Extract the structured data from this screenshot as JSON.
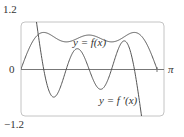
{
  "chart_data": {
    "type": "line",
    "title": "",
    "xlabel": "",
    "ylabel": "",
    "xlim": [
      0,
      3.14159
    ],
    "ylim": [
      -1.2,
      1.2
    ],
    "x_tick_labels": [
      "0",
      "π"
    ],
    "y_tick_labels": [
      "1.2",
      "-1.2"
    ],
    "grid": false,
    "legend": "inline annotations",
    "series": [
      {
        "name": "y = f(x)",
        "formula": "sin x + sin 3x / 3 + sin 5x / 5",
        "x": [
          0,
          0.26,
          0.52,
          0.79,
          1.05,
          1.31,
          1.57,
          1.83,
          2.09,
          2.36,
          2.62,
          2.88,
          3.14
        ],
        "values": [
          0,
          0.7,
          0.87,
          0.79,
          0.75,
          0.83,
          0.87,
          0.83,
          0.75,
          0.79,
          0.87,
          0.7,
          0
        ]
      },
      {
        "name": "y = f'(x)",
        "formula": "cos x + cos 3x + cos 5x",
        "x": [
          0,
          0.52,
          0.79,
          1.05,
          1.31,
          1.57,
          1.83,
          2.09,
          2.36,
          2.62,
          3.14
        ],
        "values": [
          3,
          0,
          -0.29,
          0,
          0.26,
          0,
          -0.26,
          0,
          0.29,
          0,
          -3
        ]
      }
    ],
    "annotations": [
      "y = f(x)",
      "y = f'(x)"
    ]
  },
  "labels": {
    "y_top": "1.2",
    "y_bottom": "−1.2",
    "origin": "0",
    "x_end": "π",
    "f_label": "y = f(x)",
    "fprime_label": "y = f ′(x)"
  },
  "colors": {
    "curve": "#555555",
    "frame": "#bbbbbb",
    "axis": "#777777",
    "text": "#333333"
  }
}
